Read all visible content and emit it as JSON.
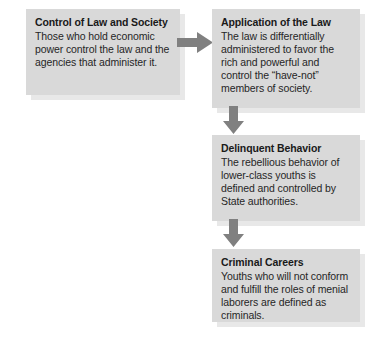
{
  "diagram": {
    "colors": {
      "box_fill": "#d9d9d9",
      "box_shadow": "#e8e8e8",
      "arrow": "#808080",
      "title_text": "#1a1a1a",
      "body_text": "#262626",
      "background": "#ffffff"
    },
    "boxes": [
      {
        "id": "control-of-law",
        "title": "Control of Law and Society",
        "body": "Those who hold economic power control the law and the agencies that administer it."
      },
      {
        "id": "application",
        "title": "Application of the Law",
        "body": "The law is differentially administered to favor the rich and powerful and control the “have-not” members of society."
      },
      {
        "id": "delinquent",
        "title": "Delinquent Behavior",
        "body": "The rebellious behavior of lower-class youths is defined and controlled by State authorities."
      },
      {
        "id": "criminal",
        "title": "Criminal Careers",
        "body": "Youths who will not conform and fulfill the roles of menial laborers are defined as criminals."
      }
    ],
    "arrows": [
      {
        "id": "control-to-application",
        "direction": "right"
      },
      {
        "id": "application-to-delinquent",
        "direction": "down"
      },
      {
        "id": "delinquent-to-criminal",
        "direction": "down"
      }
    ]
  }
}
